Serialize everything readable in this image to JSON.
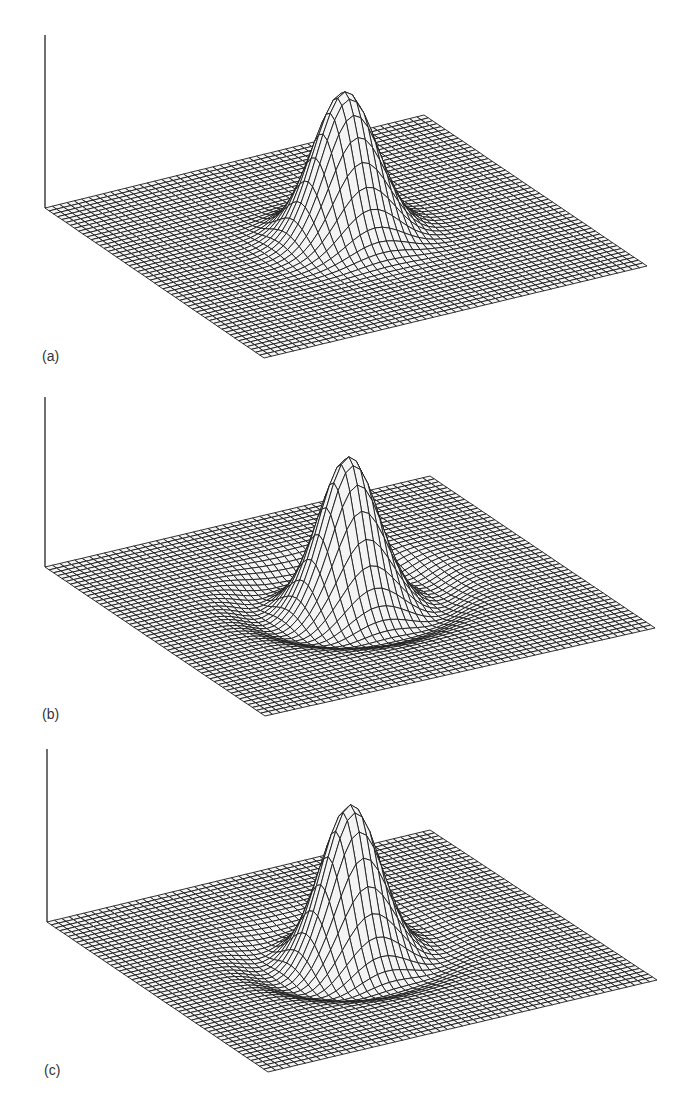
{
  "figure": {
    "grid_lines": 52,
    "line_color": "#1a1a1a",
    "panels": [
      {
        "label": "(a)",
        "top": 0,
        "height": 375,
        "axis": {
          "x": 45,
          "y_top": 35,
          "y_bottom": 208
        },
        "corners": {
          "left": [
            45,
            208
          ],
          "back": [
            424,
            115
          ],
          "right": [
            647,
            266
          ],
          "front": [
            264,
            358
          ]
        },
        "peak": {
          "u": 0.5,
          "v": 0.5,
          "height_px": 145,
          "width": 0.075
        },
        "ring": {
          "present": false,
          "amplitude": 0,
          "radius": 0,
          "width": 0
        },
        "asymmetry": 0
      },
      {
        "label": "(b)",
        "top": 375,
        "height": 362,
        "axis": {
          "x": 45,
          "y_top": 22,
          "y_bottom": 192
        },
        "corners": {
          "left": [
            45,
            192
          ],
          "back": [
            430,
            101
          ],
          "right": [
            655,
            253
          ],
          "front": [
            265,
            341
          ]
        },
        "peak": {
          "u": 0.5,
          "v": 0.5,
          "height_px": 140,
          "width": 0.065
        },
        "ring": {
          "present": true,
          "amplitude": -14,
          "radius": 0.2,
          "width": 0.05
        },
        "asymmetry": 0
      },
      {
        "label": "(c)",
        "top": 737,
        "height": 371,
        "axis": {
          "x": 47,
          "y_top": 12,
          "y_bottom": 185
        },
        "corners": {
          "left": [
            47,
            185
          ],
          "back": [
            430,
            93
          ],
          "right": [
            657,
            243
          ],
          "front": [
            268,
            335
          ]
        },
        "peak": {
          "u": 0.5,
          "v": 0.5,
          "height_px": 140,
          "width": 0.065
        },
        "ring": {
          "present": true,
          "amplitude": -10,
          "radius": 0.19,
          "width": 0.05
        },
        "asymmetry": 0.45
      }
    ]
  }
}
